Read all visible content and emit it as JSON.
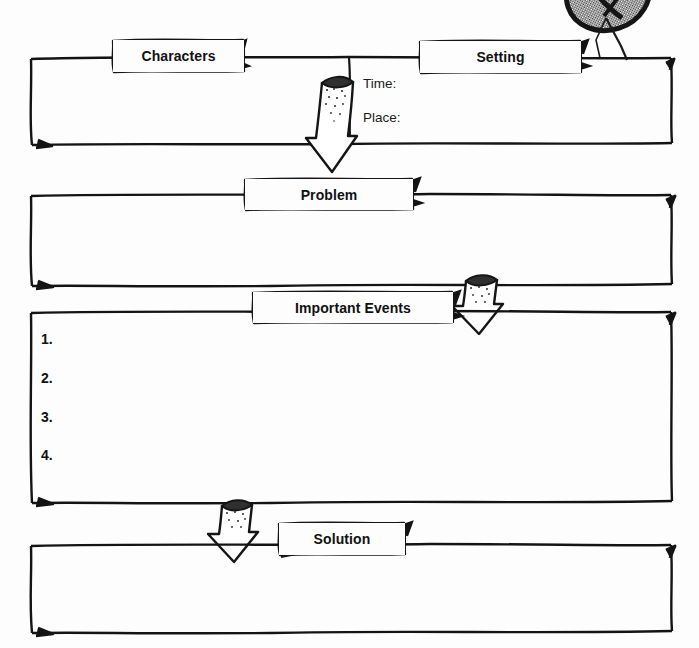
{
  "document": {
    "type": "story-map-graphic-organizer",
    "background_color": "#fdfdfd",
    "ink_color": "#111111"
  },
  "sections": {
    "characters": {
      "label": "Characters"
    },
    "setting": {
      "label": "Setting",
      "fields": [
        {
          "label": "Time:"
        },
        {
          "label": "Place:"
        }
      ]
    },
    "problem": {
      "label": "Problem"
    },
    "important_events": {
      "label": "Important Events",
      "items": [
        {
          "number": "1."
        },
        {
          "number": "2."
        },
        {
          "number": "3."
        },
        {
          "number": "4."
        }
      ]
    },
    "solution": {
      "label": "Solution"
    }
  },
  "decorations": {
    "top_right_emblem": "magnifier-icon",
    "arrows": [
      {
        "name": "arrow-setting-to-problem"
      },
      {
        "name": "arrow-problem-to-important-events"
      },
      {
        "name": "arrow-important-events-to-solution"
      }
    ]
  }
}
